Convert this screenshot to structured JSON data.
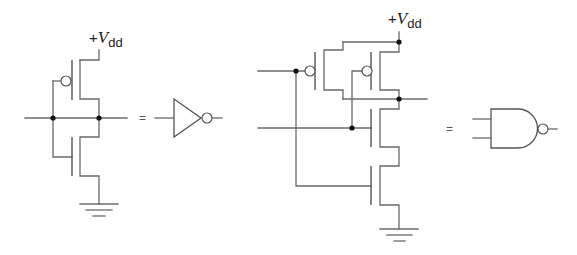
{
  "figure": {
    "width": 577,
    "height": 255,
    "colors": {
      "wire": "#6a6a6a",
      "dot": "#111111",
      "text": "#222222",
      "background": "#ffffff"
    }
  },
  "inverter_circuit": {
    "supply_label": {
      "plus": "+",
      "v": "V",
      "sub": "dd",
      "x": 89,
      "y": 43
    },
    "wires": [
      "M99,50 L99,60 L80,60",
      "M80,60 L80,99 L99,99 L99,137 L80,137 L80,176 L99,176 L99,204",
      "M25,118 L127,118",
      "M53,81 L61,81",
      "M53,81 L53,157 L72,157"
    ],
    "gate_lines": [
      "M72,60 L72,100",
      "M72,137 L72,176"
    ],
    "bubbles": [
      {
        "cx": 66,
        "cy": 81,
        "r": 5
      }
    ],
    "dots": [
      {
        "cx": 53,
        "cy": 118
      },
      {
        "cx": 99,
        "cy": 118
      }
    ],
    "ground": [
      "M80,204 L118,204",
      "M86,210 L112,210",
      "M93,216 L105,216"
    ],
    "transistors": [
      {
        "name": "pmos",
        "type": "PMOS"
      },
      {
        "name": "nmos",
        "type": "NMOS"
      }
    ]
  },
  "inverter_symbol": {
    "equals_label": "=",
    "equals_pos": {
      "x": 139,
      "y": 122
    },
    "input_wire": "M155,118 L174,118",
    "body": "M174,99 L174,137 L201,118 Z",
    "bubble": {
      "cx": 207,
      "cy": 118,
      "r": 5
    },
    "output_wire": "M212,118 L222,118"
  },
  "nand_circuit": {
    "supply_label": {
      "plus": "+",
      "v": "V",
      "sub": "dd",
      "x": 388,
      "y": 24
    },
    "wires": [
      "M399,32 L399,42",
      "M343,42 L399,42",
      "M343,42 L343,50 L324,50 L324,90 L343,90 L343,99",
      "M399,42 L399,52 L380,52 L380,90 L399,90 L399,99",
      "M343,99 L427,99",
      "M399,99 L399,109 L380,109 L380,147 L399,147 L399,166 L380,166 L380,205 L399,205 L399,229",
      "M258,71 L305,71",
      "M296,71 L296,186 L371,186",
      "M258,128 L371,128",
      "M352,128 L352,71 L362,71"
    ],
    "gate_lines": [
      "M315,52 L315,90",
      "M371,52 L371,90",
      "M371,109 L371,147",
      "M371,166 L371,205"
    ],
    "bubbles": [
      {
        "cx": 310,
        "cy": 71,
        "r": 5
      },
      {
        "cx": 367,
        "cy": 71,
        "r": 5
      }
    ],
    "dots": [
      {
        "cx": 399,
        "cy": 42
      },
      {
        "cx": 296,
        "cy": 71
      },
      {
        "cx": 399,
        "cy": 99
      },
      {
        "cx": 352,
        "cy": 128
      }
    ],
    "ground": [
      "M380,229 L418,229",
      "M387,235 L412,235",
      "M394,241 L405,241"
    ],
    "transistors": [
      {
        "name": "pmos-a",
        "type": "PMOS"
      },
      {
        "name": "pmos-b",
        "type": "PMOS"
      },
      {
        "name": "nmos-b",
        "type": "NMOS"
      },
      {
        "name": "nmos-a",
        "type": "NMOS"
      }
    ]
  },
  "nand_symbol": {
    "equals_label": "=",
    "equals_pos": {
      "x": 446,
      "y": 133
    },
    "input_wires": [
      "M473,119 L491,119",
      "M473,138 L491,138"
    ],
    "body": "M491,109 L518,109 A19.5,19.5 0 0 1 518,148 L491,148 Z",
    "bubble": {
      "cx": 543,
      "cy": 129,
      "r": 5
    },
    "output_wire": "M548,129 L557,129"
  }
}
